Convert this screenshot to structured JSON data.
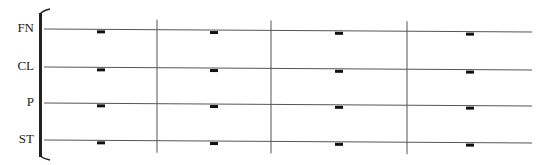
{
  "score": {
    "staves": [
      {
        "label": "FN",
        "y_left": 29,
        "y_right": 32
      },
      {
        "label": "CL",
        "y_left": 67,
        "y_right": 70
      },
      {
        "label": "P",
        "y_left": 103,
        "y_right": 106
      },
      {
        "label": "ST",
        "y_left": 140,
        "y_right": 143
      }
    ],
    "measures": 4,
    "barlines_x": [
      157,
      271,
      407
    ],
    "rests_x": [
      101,
      214,
      339,
      470
    ],
    "rest_type": "whole-rest",
    "colors": {
      "line": "#555555",
      "rest": "#111111",
      "bracket": "#222222"
    }
  }
}
